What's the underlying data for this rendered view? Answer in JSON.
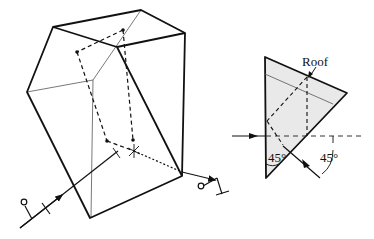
{
  "figure": {
    "left_prism": {
      "description": "Roof prism in perspective with folded ray path",
      "outer_edges": [
        [
          53,
          27,
          141,
          10
        ],
        [
          141,
          10,
          185,
          33
        ],
        [
          185,
          33,
          117,
          47
        ],
        [
          117,
          47,
          53,
          27
        ],
        [
          53,
          27,
          27,
          92
        ],
        [
          27,
          92,
          90,
          218
        ],
        [
          90,
          218,
          182,
          176
        ],
        [
          182,
          176,
          185,
          33
        ],
        [
          117,
          47,
          182,
          176
        ]
      ],
      "inner_edges": [
        [
          141,
          10,
          93,
          80
        ],
        [
          93,
          80,
          27,
          92
        ],
        [
          93,
          80,
          91,
          218
        ]
      ],
      "ray_dashed": [
        [
          123,
          30,
          77,
          52
        ],
        [
          77,
          52,
          107,
          141
        ],
        [
          123,
          30,
          133,
          141
        ],
        [
          107,
          141,
          134,
          151
        ],
        [
          133,
          141,
          133,
          151
        ]
      ],
      "ray_dotted": [
        [
          134,
          151,
          182,
          172
        ]
      ],
      "incoming_ray": [
        [
          20,
          228,
          118,
          150
        ]
      ],
      "outgoing_ray": [
        [
          182,
          172,
          200,
          178
        ]
      ]
    },
    "right_prism": {
      "description": "Cross-section of roof prism (triangle)",
      "vertices": [
        [
          265,
          57
        ],
        [
          347,
          93
        ],
        [
          266,
          178
        ]
      ],
      "fill": "#e9e9e9",
      "stroke": "#111111",
      "labels": {
        "roof": "Roof",
        "angle_left": "45°",
        "angle_right": "45°"
      }
    }
  },
  "colors": {
    "line": "#111111",
    "thin_line": "#555555",
    "prism_fill": "#e9e9e9"
  }
}
